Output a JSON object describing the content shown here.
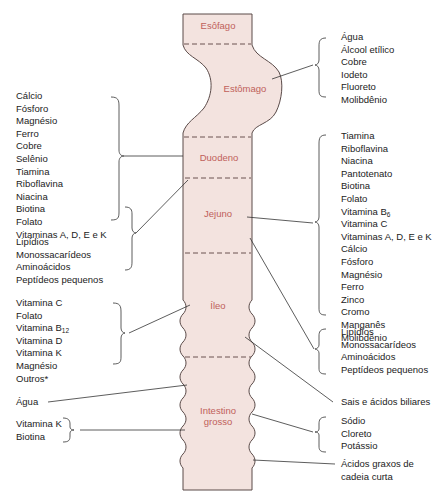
{
  "colors": {
    "tube_fill": "#f3e3df",
    "tube_stroke": "#5a4a48",
    "organ_label": "#c0605a",
    "text": "#222222",
    "line": "#333333"
  },
  "organs": {
    "esofago": "Esôfago",
    "estomago": "Estômago",
    "duodeno": "Duodeno",
    "jejuno": "Jejuno",
    "ileo": "Íleo",
    "intestino_grosso_1": "Intestino",
    "intestino_grosso_2": "grosso"
  },
  "left": {
    "duodeno_list": [
      "Cálcio",
      "Fósforo",
      "Magnésio",
      "Ferro",
      "Cobre",
      "Selênio",
      "Tiamina",
      "Riboflavina",
      "Niacina",
      "Biotina",
      "Folato",
      "Vitaminas A, D, E e K"
    ],
    "duodeno_macro": [
      "Lipídios",
      "Monossacarídeos",
      "Aminoácidos",
      "Peptídeos pequenos"
    ],
    "ileo_list": {
      "vit_c": "Vitamina C",
      "folato": "Folato",
      "vit_b12": "Vitamina B",
      "vit_b12_sub": "12",
      "vit_d": "Vitamina D",
      "vit_k": "Vitamina K",
      "magnesio": "Magnésio",
      "outros": "Outros*"
    },
    "agua": "Água",
    "colon_list": [
      "Vitamina K",
      "Biotina"
    ]
  },
  "right": {
    "estomago_list": [
      "Água",
      "Álcool etílico",
      "Cobre",
      "Iodeto",
      "Fluoreto",
      "Molibdênio"
    ],
    "jejuno_list": {
      "a": [
        "Tiamina",
        "Riboflavina",
        "Niacina",
        "Pantotenato",
        "Biotina",
        "Folato"
      ],
      "vit_b6": "Vitamina B",
      "vit_b6_sub": "6",
      "b": [
        "Vitamina C",
        "Vitaminas A, D, E e K",
        "Cálcio",
        "Fósforo",
        "Magnésio",
        "Ferro",
        "Zinco",
        "Cromo",
        "Manganês",
        "Molibdênio"
      ]
    },
    "jejuno_macro": [
      "Lipídios",
      "Monossacarídeos",
      "Aminoácidos",
      "Peptídeos pequenos"
    ],
    "sais": "Sais e ácidos biliares",
    "colon_list": [
      "Sódio",
      "Cloreto",
      "Potássio"
    ],
    "acidos_1": "Ácidos graxos de",
    "acidos_2": "cadeia curta"
  }
}
